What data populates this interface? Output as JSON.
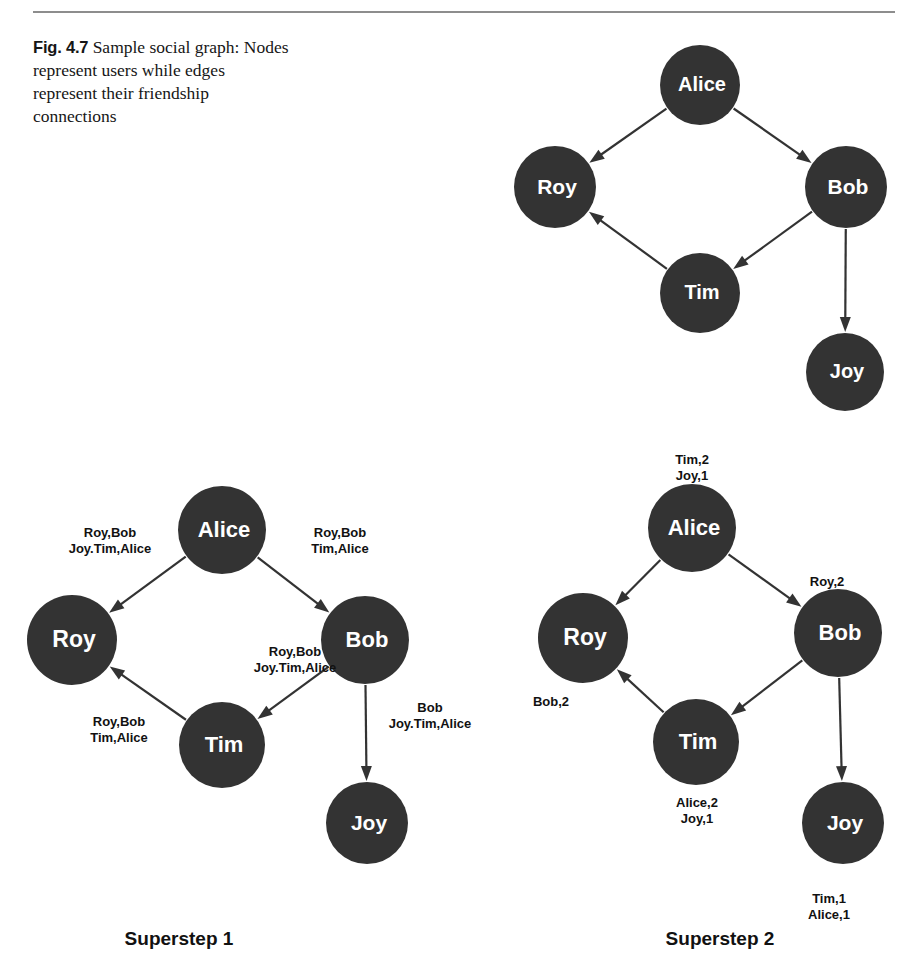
{
  "figure": {
    "caption_number": "Fig. 4.7",
    "caption_text": "Sample social graph: Nodes represent users while edges represent their friendship connections"
  },
  "panels": {
    "top": {
      "nodes": [
        {
          "id": "alice",
          "label": "Alice",
          "cx": 700,
          "cy": 85,
          "r": 40
        },
        {
          "id": "roy",
          "label": "Roy",
          "cx": 555,
          "cy": 187,
          "r": 41
        },
        {
          "id": "bob",
          "label": "Bob",
          "cx": 846,
          "cy": 187,
          "r": 41
        },
        {
          "id": "tim",
          "label": "Tim",
          "cx": 700,
          "cy": 293,
          "r": 40
        },
        {
          "id": "joy",
          "label": "Joy",
          "cx": 845,
          "cy": 372,
          "r": 39
        }
      ],
      "edges": [
        {
          "from": "alice",
          "to": "roy"
        },
        {
          "from": "alice",
          "to": "bob"
        },
        {
          "from": "bob",
          "to": "tim"
        },
        {
          "from": "tim",
          "to": "roy"
        },
        {
          "from": "bob",
          "to": "joy"
        }
      ]
    },
    "superstep1": {
      "title": "Superstep 1",
      "title_x": 179,
      "title_y": 928,
      "nodes": [
        {
          "id": "alice",
          "label": "Alice",
          "cx": 222,
          "cy": 530,
          "r": 44
        },
        {
          "id": "roy",
          "label": "Roy",
          "cx": 72,
          "cy": 640,
          "r": 45
        },
        {
          "id": "bob",
          "label": "Bob",
          "cx": 365,
          "cy": 640,
          "r": 44
        },
        {
          "id": "tim",
          "label": "Tim",
          "cx": 222,
          "cy": 745,
          "r": 43
        },
        {
          "id": "joy",
          "label": "Joy",
          "cx": 367,
          "cy": 823,
          "r": 41
        }
      ],
      "edges": [
        {
          "from": "alice",
          "to": "roy"
        },
        {
          "from": "alice",
          "to": "bob"
        },
        {
          "from": "bob",
          "to": "tim"
        },
        {
          "from": "tim",
          "to": "roy"
        },
        {
          "from": "bob",
          "to": "joy"
        }
      ],
      "messages": [
        {
          "name": "alice-to-roy-message",
          "text": "Roy,Bob\nJoy.Tim,Alice",
          "x": 110,
          "y": 525,
          "align": "center"
        },
        {
          "name": "alice-to-bob-message",
          "text": "Roy,Bob\nTim,Alice",
          "x": 340,
          "y": 525,
          "align": "center"
        },
        {
          "name": "bob-to-tim-message",
          "text": "Roy,Bob\nJoy.Tim,Alice",
          "x": 295,
          "y": 644,
          "align": "center"
        },
        {
          "name": "bob-to-joy-message",
          "text": "Bob\nJoy.Tim,Alice",
          "x": 430,
          "y": 700,
          "align": "center"
        },
        {
          "name": "tim-to-roy-message",
          "text": "Roy,Bob\nTim,Alice",
          "x": 119,
          "y": 714,
          "align": "center"
        }
      ]
    },
    "superstep2": {
      "title": "Superstep 2",
      "title_x": 720,
      "title_y": 928,
      "nodes": [
        {
          "id": "alice",
          "label": "Alice",
          "cx": 692,
          "cy": 528,
          "r": 44
        },
        {
          "id": "roy",
          "label": "Roy",
          "cx": 583,
          "cy": 638,
          "r": 45
        },
        {
          "id": "bob",
          "label": "Bob",
          "cx": 838,
          "cy": 633,
          "r": 44
        },
        {
          "id": "tim",
          "label": "Tim",
          "cx": 696,
          "cy": 742,
          "r": 43
        },
        {
          "id": "joy",
          "label": "Joy",
          "cx": 843,
          "cy": 823,
          "r": 41
        }
      ],
      "edges": [
        {
          "from": "alice",
          "to": "roy"
        },
        {
          "from": "alice",
          "to": "bob"
        },
        {
          "from": "bob",
          "to": "tim"
        },
        {
          "from": "tim",
          "to": "roy"
        },
        {
          "from": "bob",
          "to": "joy"
        }
      ],
      "messages": [
        {
          "name": "alice-value-message",
          "text": "Tim,2\nJoy,1",
          "x": 692,
          "y": 452,
          "align": "center"
        },
        {
          "name": "bob-value-message",
          "text": "Roy,2",
          "x": 827,
          "y": 574,
          "align": "center"
        },
        {
          "name": "roy-value-message",
          "text": "Bob,2",
          "x": 551,
          "y": 694,
          "align": "center"
        },
        {
          "name": "tim-value-message",
          "text": "Alice,2\nJoy,1",
          "x": 697,
          "y": 795,
          "align": "center"
        },
        {
          "name": "joy-value-message",
          "text": "Tim,1\nAlice,1",
          "x": 829,
          "y": 891,
          "align": "center"
        }
      ]
    }
  },
  "colors": {
    "node_fill": "#333333",
    "node_text": "#ffffff",
    "edge": "#333333",
    "rule": "#8d8d8d",
    "background": "#ffffff"
  }
}
